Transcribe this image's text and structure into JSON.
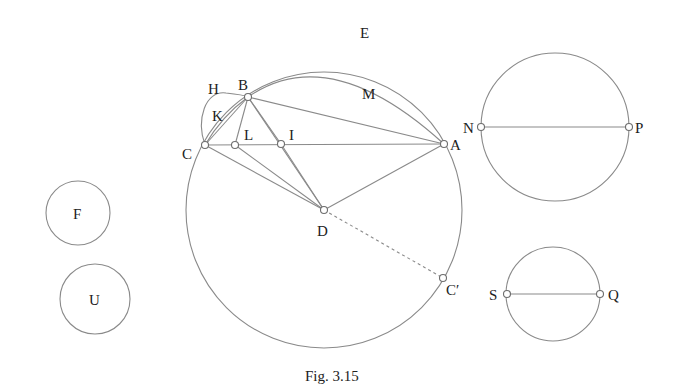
{
  "figure": {
    "caption": "Fig. 3.15",
    "stroke_color": "#8a8a8a",
    "text_color": "#222222"
  },
  "points": {
    "A": {
      "label": "A",
      "x": 444,
      "y": 144
    },
    "B": {
      "label": "B",
      "x": 248,
      "y": 97
    },
    "C": {
      "label": "C",
      "x": 205,
      "y": 145
    },
    "L": {
      "label": "L",
      "x": 235,
      "y": 145
    },
    "I": {
      "label": "I",
      "x": 281,
      "y": 144
    },
    "D": {
      "label": "D",
      "x": 324,
      "y": 210
    },
    "C_prime": {
      "label": "C′",
      "x": 443,
      "y": 278
    },
    "N": {
      "label": "N",
      "x": 481,
      "y": 127
    },
    "P": {
      "label": "P",
      "x": 629,
      "y": 127
    },
    "S": {
      "label": "S",
      "x": 507,
      "y": 294
    },
    "Q": {
      "label": "Q",
      "x": 600,
      "y": 294
    }
  },
  "arc_labels": {
    "E": "E",
    "M": "M",
    "H": "H",
    "K": "K"
  },
  "circles": {
    "main": {
      "name": "circle-D",
      "cx": 324,
      "cy": 210,
      "r": 138
    },
    "NP": {
      "name": "circle-NP",
      "cx": 555,
      "cy": 127,
      "r": 74
    },
    "SQ": {
      "name": "circle-SQ",
      "cx": 553,
      "cy": 294,
      "r": 47
    },
    "F": {
      "label": "F",
      "cx": 78,
      "cy": 213,
      "r": 32
    },
    "U": {
      "label": "U",
      "cx": 95,
      "cy": 299,
      "r": 35
    }
  },
  "segments": [
    [
      "C",
      "A"
    ],
    [
      "B",
      "A"
    ],
    [
      "B",
      "C"
    ],
    [
      "B",
      "L"
    ],
    [
      "B",
      "I"
    ],
    [
      "B",
      "D"
    ],
    [
      "C",
      "D"
    ],
    [
      "L",
      "D"
    ],
    [
      "I",
      "D"
    ],
    [
      "A",
      "D"
    ],
    [
      "N",
      "P"
    ],
    [
      "S",
      "Q"
    ]
  ],
  "dashed_segments": [
    [
      "D",
      "C_prime"
    ]
  ]
}
